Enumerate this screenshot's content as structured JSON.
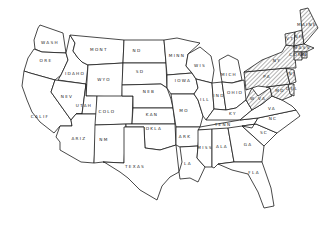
{
  "map": {
    "type": "outline map of the contiguous United States",
    "style": "black outline on white, hatched highlight",
    "highlight_pattern": "diagonal hatching",
    "highlight_color": "#1a1a1a",
    "states": [
      {
        "id": "wa",
        "label": "WASH",
        "hatched": false
      },
      {
        "id": "or",
        "label": "ORE",
        "hatched": false
      },
      {
        "id": "ca",
        "label": "CALIF",
        "hatched": false
      },
      {
        "id": "id",
        "label": "IDAHO",
        "hatched": false
      },
      {
        "id": "nv",
        "label": "NEV",
        "hatched": false
      },
      {
        "id": "mt",
        "label": "MONT",
        "hatched": false
      },
      {
        "id": "wy",
        "label": "WYO",
        "hatched": false
      },
      {
        "id": "ut",
        "label": "UTAH",
        "hatched": false
      },
      {
        "id": "az",
        "label": "ARIZ",
        "hatched": false
      },
      {
        "id": "co",
        "label": "COLO",
        "hatched": false
      },
      {
        "id": "nm",
        "label": "NM",
        "hatched": false
      },
      {
        "id": "nd",
        "label": "ND",
        "hatched": false
      },
      {
        "id": "sd",
        "label": "SD",
        "hatched": false
      },
      {
        "id": "ne",
        "label": "NEB",
        "hatched": false
      },
      {
        "id": "ks",
        "label": "KAN",
        "hatched": false
      },
      {
        "id": "ok",
        "label": "OKLA",
        "hatched": false
      },
      {
        "id": "tx",
        "label": "TEXAS",
        "hatched": false
      },
      {
        "id": "mn",
        "label": "MINN",
        "hatched": false
      },
      {
        "id": "ia",
        "label": "IOWA",
        "hatched": false
      },
      {
        "id": "mo",
        "label": "MO",
        "hatched": false
      },
      {
        "id": "ar",
        "label": "ARK",
        "hatched": false
      },
      {
        "id": "la",
        "label": "LA",
        "hatched": false
      },
      {
        "id": "wi",
        "label": "WIS",
        "hatched": false
      },
      {
        "id": "il",
        "label": "ILL",
        "hatched": false
      },
      {
        "id": "mi",
        "label": "MICH",
        "hatched": false
      },
      {
        "id": "in",
        "label": "IND",
        "hatched": false
      },
      {
        "id": "oh",
        "label": "OHIO",
        "hatched": false
      },
      {
        "id": "ky",
        "label": "KY",
        "hatched": false
      },
      {
        "id": "tn",
        "label": "TENN",
        "hatched": false
      },
      {
        "id": "ms",
        "label": "MISS",
        "hatched": false
      },
      {
        "id": "al",
        "label": "ALA",
        "hatched": false
      },
      {
        "id": "ga",
        "label": "GA",
        "hatched": false
      },
      {
        "id": "fl",
        "label": "FLA",
        "hatched": false
      },
      {
        "id": "sc",
        "label": "SC",
        "hatched": false
      },
      {
        "id": "nc",
        "label": "NC",
        "hatched": false
      },
      {
        "id": "va",
        "label": "VA",
        "hatched": false
      },
      {
        "id": "wv",
        "label": "W VA",
        "hatched": true
      },
      {
        "id": "md",
        "label": "MD",
        "hatched": true
      },
      {
        "id": "de",
        "label": "DEL",
        "hatched": true
      },
      {
        "id": "pa",
        "label": "PA",
        "hatched": true
      },
      {
        "id": "nj",
        "label": "NJ",
        "hatched": true
      },
      {
        "id": "ny",
        "label": "NY",
        "hatched": true
      },
      {
        "id": "vt",
        "label": "VT",
        "hatched": true
      },
      {
        "id": "nh",
        "label": "NH",
        "hatched": true
      },
      {
        "id": "ma",
        "label": "MASS",
        "hatched": true
      },
      {
        "id": "ct",
        "label": "CONN",
        "hatched": true
      },
      {
        "id": "ri",
        "label": "RI",
        "hatched": true
      },
      {
        "id": "me",
        "label": "MAINE",
        "hatched": true
      }
    ]
  }
}
